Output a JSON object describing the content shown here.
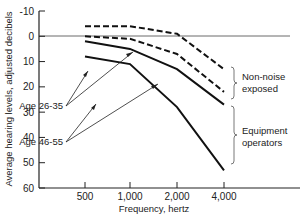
{
  "chart_data": {
    "type": "line",
    "title": "",
    "xlabel": "Frequency, hertz",
    "ylabel": "Average hearing levels, adjusted decibels",
    "categories": [
      "500",
      "1,000",
      "2,000",
      "4,000"
    ],
    "y_ticks": [
      "-10",
      "0",
      "10",
      "20",
      "30",
      "40",
      "50",
      "60"
    ],
    "ylim": [
      -10,
      60
    ],
    "y_inverted": true,
    "grid": false,
    "reference_line_y": 0,
    "series": [
      {
        "name": "Non-noise exposed, Age 26-35",
        "group": "Non-noise exposed",
        "age": "Age 26-35",
        "style": "dashed",
        "values": [
          -4,
          -4,
          -1,
          13
        ]
      },
      {
        "name": "Non-noise exposed, Age 46-55",
        "group": "Non-noise exposed",
        "age": "Age 46-55",
        "style": "dashed",
        "values": [
          0,
          1,
          7,
          22
        ]
      },
      {
        "name": "Equipment operators, Age 26-35",
        "group": "Equipment operators",
        "age": "Age 26-35",
        "style": "solid",
        "values": [
          2,
          5,
          13,
          27
        ]
      },
      {
        "name": "Equipment operators, Age 46-55",
        "group": "Equipment operators",
        "age": "Age 46-55",
        "style": "solid",
        "values": [
          8,
          11,
          28,
          53
        ]
      }
    ],
    "annotations": {
      "age_young": "Age 26-35",
      "age_old": "Age 46-55",
      "group_nonnoise_line1": "Non-noise",
      "group_nonnoise_line2": "exposed",
      "group_equip_line1": "Equipment",
      "group_equip_line2": "operators"
    }
  }
}
